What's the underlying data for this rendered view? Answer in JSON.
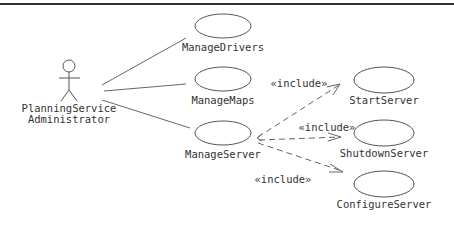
{
  "diagram": {
    "type": "UML use case diagram",
    "actor": {
      "name_line1": "PlanningService",
      "name_line2": "Administrator"
    },
    "use_cases": {
      "manage_drivers": "ManageDrivers",
      "manage_maps": "ManageMaps",
      "manage_server": "ManageServer",
      "start_server": "StartServer",
      "shutdown_server": "ShutdownServer",
      "configure_server": "ConfigureServer"
    },
    "relationships": {
      "include_start": "«include»",
      "include_shutdown": "«include»",
      "include_configure": "«include»"
    },
    "associations": [
      {
        "from": "PlanningService Administrator",
        "to": "ManageDrivers"
      },
      {
        "from": "PlanningService Administrator",
        "to": "ManageMaps"
      },
      {
        "from": "PlanningService Administrator",
        "to": "ManageServer"
      }
    ],
    "includes": [
      {
        "from": "ManageServer",
        "to": "StartServer",
        "stereotype": "«include»"
      },
      {
        "from": "ManageServer",
        "to": "ShutdownServer",
        "stereotype": "«include»"
      },
      {
        "from": "ManageServer",
        "to": "ConfigureServer",
        "stereotype": "«include»"
      }
    ]
  }
}
